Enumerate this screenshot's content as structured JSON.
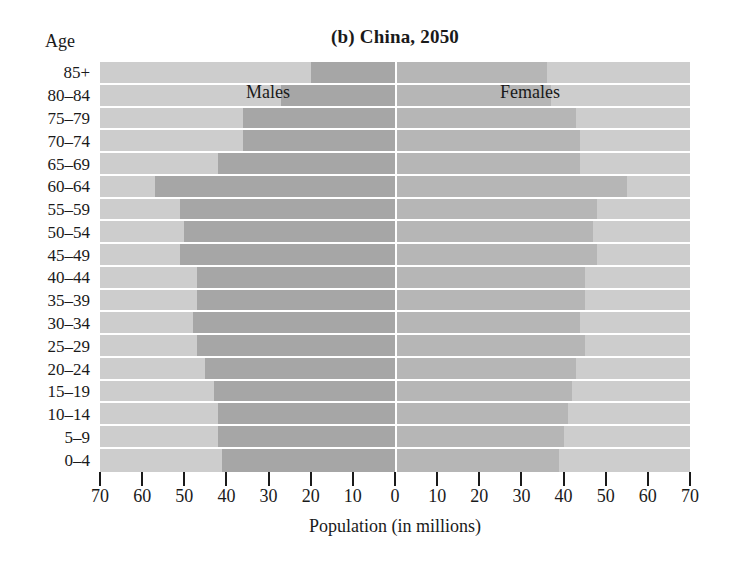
{
  "figure": {
    "title": "(b) China, 2050",
    "age_axis_heading": "Age",
    "x_axis_title": "Population (in millions)",
    "series_labels": {
      "males": "Males",
      "females": "Females"
    }
  },
  "colors": {
    "plot_background": "#cdcdcd",
    "male_bar": "#a6a6a6",
    "female_bar": "#b6b6b6",
    "gridline": "#ffffff",
    "text": "#1a1a1a"
  },
  "chart_data": {
    "type": "bar",
    "subtype": "population-pyramid",
    "title": "(b) China, 2050",
    "xlabel": "Population (in millions)",
    "ylabel": "Age",
    "xlim": [
      -70,
      70
    ],
    "xticks": [
      70,
      60,
      50,
      40,
      30,
      20,
      10,
      0,
      10,
      20,
      30,
      40,
      50,
      60,
      70
    ],
    "xtick_labels": [
      "70",
      "60",
      "50",
      "40",
      "30",
      "20",
      "10",
      "0",
      "10",
      "20",
      "30",
      "40",
      "50",
      "60",
      "70"
    ],
    "grid": true,
    "legend": [
      "Males",
      "Females"
    ],
    "legend_position": "inside-plot",
    "categories": [
      "85+",
      "80–84",
      "75–79",
      "70–74",
      "65–69",
      "60–64",
      "55–59",
      "50–54",
      "45–49",
      "40–44",
      "35–39",
      "30–34",
      "25–29",
      "20–24",
      "15–19",
      "10–14",
      "5–9",
      "0–4"
    ],
    "series": [
      {
        "name": "Males",
        "direction": "left",
        "values": [
          20,
          27,
          36,
          36,
          42,
          57,
          51,
          50,
          51,
          47,
          47,
          48,
          47,
          45,
          43,
          42,
          42,
          41
        ]
      },
      {
        "name": "Females",
        "direction": "right",
        "values": [
          36,
          37,
          43,
          44,
          44,
          55,
          48,
          47,
          48,
          45,
          45,
          44,
          45,
          43,
          42,
          41,
          40,
          39
        ]
      }
    ]
  }
}
